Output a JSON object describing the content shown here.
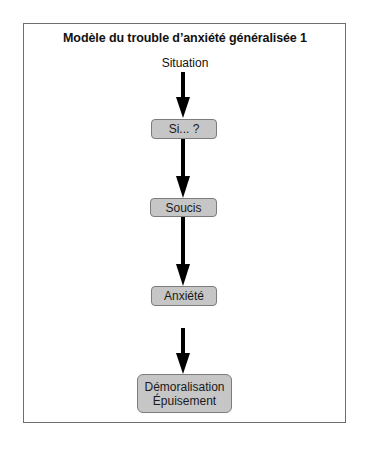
{
  "diagram": {
    "title": "Modèle du trouble d’anxiété généralisée 1",
    "start_label": "Situation",
    "nodes": [
      {
        "id": "si",
        "lines": [
          "Si... ?"
        ]
      },
      {
        "id": "soucis",
        "lines": [
          "Soucis"
        ]
      },
      {
        "id": "anxiete",
        "lines": [
          "Anxiété"
        ]
      },
      {
        "id": "demoralisation",
        "lines": [
          "Démoralisation",
          "Épuisement"
        ]
      }
    ],
    "edges": [
      {
        "from": "Situation",
        "to": "Si... ?"
      },
      {
        "from": "Si... ?",
        "to": "Soucis"
      },
      {
        "from": "Soucis",
        "to": "Anxiété"
      },
      {
        "from": "Anxiété",
        "to": "Démoralisation / Épuisement"
      }
    ],
    "colors": {
      "node_fill": "#c6c6c6",
      "node_border": "#7c7c7c",
      "arrow": "#000000",
      "frame": "#6e6e6e"
    }
  }
}
